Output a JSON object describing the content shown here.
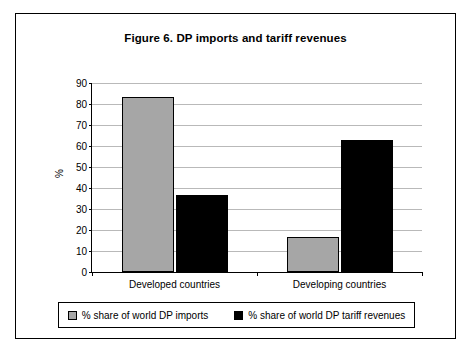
{
  "chart_data": {
    "type": "bar",
    "title": "Figure 6. DP imports and tariff revenues",
    "xlabel": "",
    "ylabel": "%",
    "categories": [
      "Developed countries",
      "Developing countries"
    ],
    "series": [
      {
        "name": "% share of world DP imports",
        "color": "#a6a6a6",
        "values": [
          83.5,
          16.5
        ]
      },
      {
        "name": "% share of world DP tariff revenues",
        "color": "#000000",
        "values": [
          36.5,
          63.0
        ]
      }
    ],
    "ylim": [
      0,
      90
    ],
    "yticks": [
      0,
      10,
      20,
      30,
      40,
      50,
      60,
      70,
      80,
      90
    ],
    "ytick_labels": [
      "0",
      "10",
      "20",
      "30",
      "40",
      "50",
      "60",
      "70",
      "80",
      "90"
    ],
    "grid": true,
    "legend_position": "bottom"
  }
}
